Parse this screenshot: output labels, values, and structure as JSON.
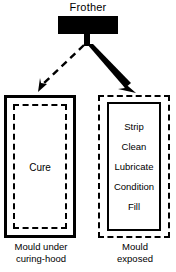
{
  "diagram": {
    "source": {
      "title": "Frother",
      "node_name": "frother-block",
      "fill_color": "#000000"
    },
    "branches": [
      {
        "id": "cure",
        "contents": [
          "Cure"
        ],
        "caption_lines": [
          "Mould under",
          "curing-hood"
        ],
        "outer_border_style": "solid",
        "inner_border_style": "dashed",
        "arrow": {
          "style": "dashed",
          "weight": "thin",
          "direction": "down-left"
        }
      },
      {
        "id": "service",
        "contents": [
          "Strip",
          "Clean",
          "Lubricate",
          "Condition",
          "Fill"
        ],
        "caption_lines": [
          "Mould",
          "exposed"
        ],
        "outer_border_style": "dash-dot",
        "inner_border_style": "solid",
        "arrow": {
          "style": "solid",
          "weight": "thick",
          "direction": "down-right"
        }
      }
    ],
    "colors": {
      "ink": "#000000",
      "background": "#ffffff"
    }
  }
}
